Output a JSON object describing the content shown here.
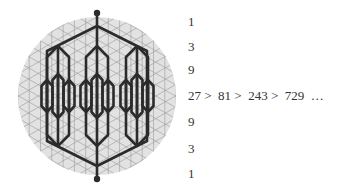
{
  "figure": {
    "colors": {
      "background": "#ffffff",
      "circle_fill": "#e2e2e2",
      "grid_lines": "#9a9a9a",
      "tree_lines": "#2b2b2b",
      "text": "#333333"
    },
    "branching_factor": 3
  },
  "levels": [
    {
      "label": "1",
      "y": 23
    },
    {
      "label": "3",
      "y": 48
    },
    {
      "label": "9",
      "y": 71
    },
    {
      "label": "27 >  81 >  243 >  729  …",
      "y": 97
    },
    {
      "label": "9",
      "y": 123
    },
    {
      "label": "3",
      "y": 150
    },
    {
      "label": "1",
      "y": 175
    }
  ]
}
